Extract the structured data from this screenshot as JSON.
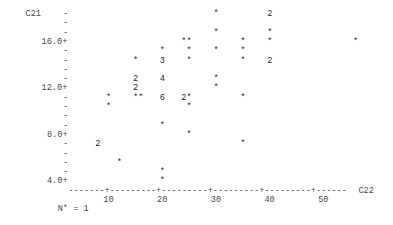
{
  "chart_data": {
    "type": "scatter",
    "title": "",
    "xlabel": "C22",
    "ylabel": "C21",
    "renderer": "character-plot",
    "x_ticks": [
      10,
      20,
      30,
      40,
      50
    ],
    "x_tick_labels": [
      "10",
      "20",
      "30",
      "40",
      "50"
    ],
    "y_ticks": [
      4.0,
      8.0,
      12.0,
      16.0
    ],
    "y_tick_labels": [
      "4.0+",
      "8.0+",
      "12.0+",
      "16.0+"
    ],
    "xlim": [
      3,
      57
    ],
    "ylim": [
      4.0,
      18.4
    ],
    "grid": false,
    "legend": null,
    "footnote": "N* = 1",
    "missing_count": 1,
    "symbol_legend": {
      "*": "1 observation",
      "digit": "number of coincident observations"
    },
    "points": [
      {
        "x": 30,
        "y": 18.4,
        "symbol": "*",
        "count": 1
      },
      {
        "x": 40,
        "y": 18.4,
        "symbol": "2",
        "count": 2
      },
      {
        "x": 30,
        "y": 16.8,
        "symbol": "*",
        "count": 1
      },
      {
        "x": 40,
        "y": 16.8,
        "symbol": "*",
        "count": 1
      },
      {
        "x": 24,
        "y": 16.0,
        "symbol": "*",
        "count": 1
      },
      {
        "x": 25,
        "y": 16.0,
        "symbol": "*",
        "count": 1
      },
      {
        "x": 35,
        "y": 16.0,
        "symbol": "*",
        "count": 1
      },
      {
        "x": 40,
        "y": 16.0,
        "symbol": "*",
        "count": 1
      },
      {
        "x": 56,
        "y": 16.0,
        "symbol": "*",
        "count": 1
      },
      {
        "x": 20,
        "y": 15.2,
        "symbol": "*",
        "count": 1
      },
      {
        "x": 25,
        "y": 15.2,
        "symbol": "*",
        "count": 1
      },
      {
        "x": 30,
        "y": 15.2,
        "symbol": "*",
        "count": 1
      },
      {
        "x": 35,
        "y": 15.2,
        "symbol": "*",
        "count": 1
      },
      {
        "x": 15,
        "y": 14.4,
        "symbol": "*",
        "count": 1
      },
      {
        "x": 20,
        "y": 14.4,
        "symbol": "3",
        "count": 3
      },
      {
        "x": 25,
        "y": 14.4,
        "symbol": "*",
        "count": 1
      },
      {
        "x": 35,
        "y": 14.4,
        "symbol": "*",
        "count": 1
      },
      {
        "x": 40,
        "y": 14.4,
        "symbol": "2",
        "count": 2
      },
      {
        "x": 15,
        "y": 12.8,
        "symbol": "2",
        "count": 2
      },
      {
        "x": 20,
        "y": 12.8,
        "symbol": "4",
        "count": 4
      },
      {
        "x": 30,
        "y": 12.8,
        "symbol": "*",
        "count": 1
      },
      {
        "x": 15,
        "y": 12.0,
        "symbol": "2",
        "count": 2
      },
      {
        "x": 30,
        "y": 12.0,
        "symbol": "*",
        "count": 1
      },
      {
        "x": 10,
        "y": 11.2,
        "symbol": "*",
        "count": 1
      },
      {
        "x": 15,
        "y": 11.2,
        "symbol": "*",
        "count": 1
      },
      {
        "x": 16,
        "y": 11.2,
        "symbol": "*",
        "count": 1
      },
      {
        "x": 20,
        "y": 11.2,
        "symbol": "6",
        "count": 6
      },
      {
        "x": 24,
        "y": 11.2,
        "symbol": "2",
        "count": 2
      },
      {
        "x": 25,
        "y": 11.2,
        "symbol": "*",
        "count": 1
      },
      {
        "x": 35,
        "y": 11.2,
        "symbol": "*",
        "count": 1
      },
      {
        "x": 10,
        "y": 10.4,
        "symbol": "*",
        "count": 1
      },
      {
        "x": 25,
        "y": 10.4,
        "symbol": "*",
        "count": 1
      },
      {
        "x": 20,
        "y": 8.8,
        "symbol": "*",
        "count": 1
      },
      {
        "x": 25,
        "y": 8.0,
        "symbol": "*",
        "count": 1
      },
      {
        "x": 8,
        "y": 7.2,
        "symbol": "2",
        "count": 2
      },
      {
        "x": 35,
        "y": 7.2,
        "symbol": "*",
        "count": 1
      },
      {
        "x": 12,
        "y": 5.6,
        "symbol": "*",
        "count": 1
      },
      {
        "x": 20,
        "y": 4.8,
        "symbol": "*",
        "count": 1
      },
      {
        "x": 20,
        "y": 4.0,
        "symbol": "*",
        "count": 1
      }
    ]
  },
  "layout": {
    "char_w": 5.37,
    "line_h": 9.3,
    "origin_x": 4,
    "origin_y": 10,
    "y_axis_col": 11,
    "y_axis_label_col": 4,
    "x_axis_line": 19,
    "x_tick_label_line": 20,
    "footnote_line": 21,
    "footnote_col": 10,
    "x_axis_start_col": 12,
    "x_axis_end_col": 65,
    "x_col_offset": 9,
    "y_top_value": 18.4,
    "y_step": 0.8,
    "y_label_lines": {
      "16.0+": 3,
      "12.0+": 8,
      "8.0+": 13,
      "4.0+": 18
    },
    "axis_plus_cols": [
      19,
      29,
      39,
      49,
      59
    ],
    "xlabel_col": 66
  }
}
